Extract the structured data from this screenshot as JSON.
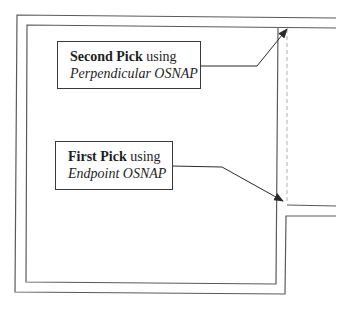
{
  "diagram": {
    "type": "floor-plan-wall-offset",
    "callouts": [
      {
        "id": "second-pick",
        "title_bold": "Second Pick",
        "title_rest": " using",
        "subtitle": "Perpendicular OSNAP"
      },
      {
        "id": "first-pick",
        "title_bold": "First Pick",
        "title_rest": " using",
        "subtitle": "Endpoint OSNAP"
      }
    ],
    "colors": {
      "wall_line": "#5a5a5a",
      "arrow": "#2a2a2a",
      "dashed_line": "#b0b0b0",
      "background": "#ffffff"
    }
  }
}
